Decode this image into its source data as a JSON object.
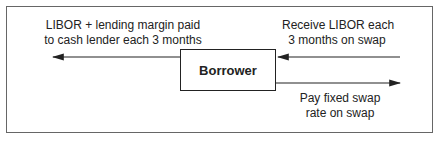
{
  "diagram": {
    "center_node": "Borrower",
    "labels": {
      "left_line1": "LIBOR + lending margin paid",
      "left_line2": "to cash lender each 3 months",
      "right_top_line1": "Receive LIBOR each",
      "right_top_line2": "3 months on swap",
      "right_bottom_line1": "Pay fixed swap",
      "right_bottom_line2": "rate on swap"
    },
    "arrows": [
      {
        "from": "Borrower",
        "to": "cash lender",
        "label": "LIBOR + lending margin paid to cash lender each 3 months"
      },
      {
        "from": "swap",
        "to": "Borrower",
        "label": "Receive LIBOR each 3 months on swap"
      },
      {
        "from": "Borrower",
        "to": "swap",
        "label": "Pay fixed swap rate on swap"
      }
    ]
  }
}
